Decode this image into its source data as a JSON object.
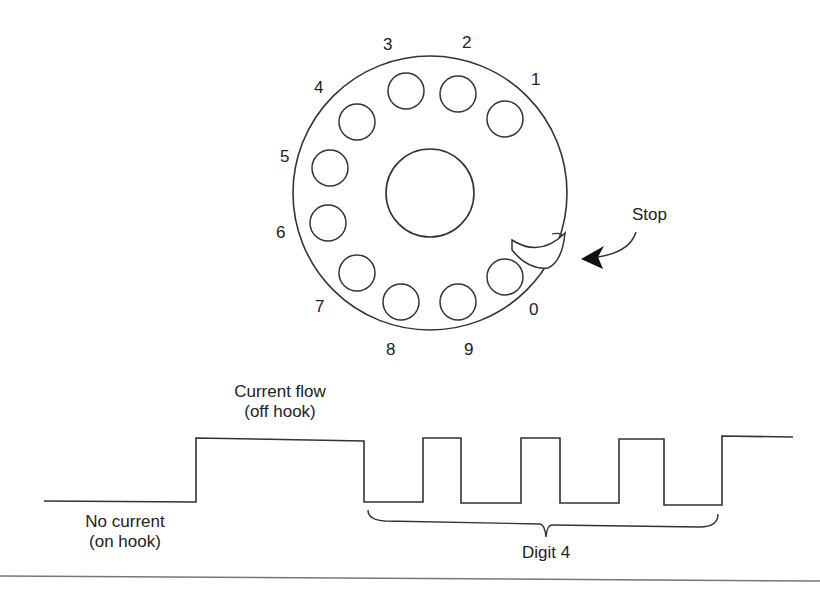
{
  "dial": {
    "center": [
      430,
      193
    ],
    "radius": 137,
    "hub_radius": 44,
    "hole_radius": 18,
    "holes": [
      {
        "digit": "1",
        "cx": 505,
        "cy": 119,
        "lx": 537,
        "ly": 80
      },
      {
        "digit": "2",
        "cx": 458,
        "cy": 94,
        "lx": 468,
        "ly": 43
      },
      {
        "digit": "3",
        "cx": 406,
        "cy": 91,
        "lx": 389,
        "ly": 45
      },
      {
        "digit": "4",
        "cx": 357,
        "cy": 122,
        "lx": 320,
        "ly": 88
      },
      {
        "digit": "5",
        "cx": 330,
        "cy": 168,
        "lx": 286,
        "ly": 157
      },
      {
        "digit": "6",
        "cx": 328,
        "cy": 223,
        "lx": 282,
        "ly": 233
      },
      {
        "digit": "7",
        "cx": 357,
        "cy": 273,
        "lx": 321,
        "ly": 307
      },
      {
        "digit": "8",
        "cx": 401,
        "cy": 302,
        "lx": 392,
        "ly": 350
      },
      {
        "digit": "9",
        "cx": 458,
        "cy": 302,
        "lx": 470,
        "ly": 350
      },
      {
        "digit": "0",
        "cx": 505,
        "cy": 277,
        "lx": 535,
        "ly": 310
      }
    ],
    "stop_label": "Stop",
    "stop_label_pos": [
      655,
      215
    ]
  },
  "waveform": {
    "title_line1": "Current flow",
    "title_line2": "(off hook)",
    "no_current_line1": "No current",
    "no_current_line2": "(on hook)",
    "digit_label": "Digit 4",
    "pulse_count": 4,
    "stroke_color": "#333333"
  }
}
